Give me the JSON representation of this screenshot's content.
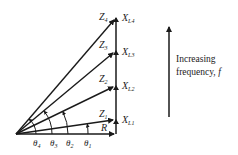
{
  "diagram": {
    "origin": {
      "x": 16,
      "y": 134
    },
    "vertical_x": 116,
    "impedances": [
      {
        "z_label": "Z",
        "z_sub": "1",
        "x_label": "X",
        "x_sub": "L1",
        "tip_y": 120,
        "theta": "θ",
        "theta_sub": "1",
        "theta_x": 102
      },
      {
        "z_label": "Z",
        "z_sub": "2",
        "x_label": "X",
        "x_sub": "L2",
        "tip_y": 86,
        "theta": "θ",
        "theta_sub": "2",
        "theta_x": 69
      },
      {
        "z_label": "Z",
        "z_sub": "3",
        "x_label": "X",
        "x_sub": "L3",
        "tip_y": 51,
        "theta": "θ",
        "theta_sub": "3",
        "theta_x": 52
      },
      {
        "z_label": "Z",
        "z_sub": "4",
        "x_label": "X",
        "x_sub": "L4",
        "tip_y": 18,
        "theta": "θ",
        "theta_sub": "4",
        "theta_x": 36
      }
    ],
    "resistance_label": "R",
    "frequency_arrow": {
      "line1": "Increasing",
      "line2": "frequency, ",
      "var": "f"
    },
    "colors": {
      "line": "#1a1a1a",
      "text": "#222222",
      "background": "#ffffff"
    }
  }
}
